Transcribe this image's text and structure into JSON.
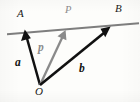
{
  "figure": {
    "background_color": "#fdfdfb",
    "width": 140,
    "height": 102,
    "labels": {
      "point_a": "A",
      "point_b": "B",
      "point_o": "O",
      "point_p_upper": "P",
      "vector_a": "a",
      "vector_b": "b",
      "vector_p": "p"
    },
    "colors": {
      "black": "#111111",
      "gray": "#8a8a8a",
      "line_gray": "#7e7e7e"
    },
    "geometry": {
      "origin": {
        "x": 40,
        "y": 85
      },
      "line_ab": {
        "x1": 7,
        "y1": 34,
        "x2": 139,
        "y2": 23
      },
      "vector_a": {
        "x1": 40,
        "y1": 85,
        "x2": 25,
        "y2": 31
      },
      "vector_p": {
        "x1": 40,
        "y1": 85,
        "x2": 65,
        "y2": 31
      },
      "vector_b": {
        "x1": 40,
        "y1": 85,
        "x2": 111,
        "y2": 27
      }
    }
  }
}
